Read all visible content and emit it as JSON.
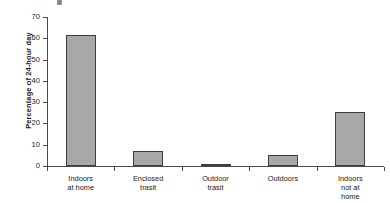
{
  "chart_data": {
    "type": "bar",
    "title": "",
    "subtitle": "",
    "xlabel": "",
    "ylabel": "Percentage of 24-hour day",
    "categories": [
      "Indoors at home",
      "Enclosed trasit",
      "Outdoor trasit",
      "Outdoors",
      "Indoors not at home"
    ],
    "category_lines": [
      [
        "Indoors",
        "at home"
      ],
      [
        "Enclosed",
        "trasit"
      ],
      [
        "Outdoor",
        "trasit"
      ],
      [
        "Outdoors"
      ],
      [
        "Indoors",
        "not at",
        "home"
      ]
    ],
    "values": [
      61.5,
      7.0,
      1.0,
      5.0,
      25.5
    ],
    "ylim": [
      0,
      70
    ],
    "yticks": [
      0,
      10,
      20,
      30,
      40,
      50,
      60,
      70
    ],
    "ytick_labels": [
      "0",
      "10",
      "20",
      "30",
      "40",
      "50",
      "60",
      "70"
    ],
    "grid": false,
    "legend": false,
    "legend_position": "none",
    "bar_color": "#a8a8a8",
    "bar_edge_color": "#3d3d3d",
    "axis_color": "#4a4a4a"
  }
}
